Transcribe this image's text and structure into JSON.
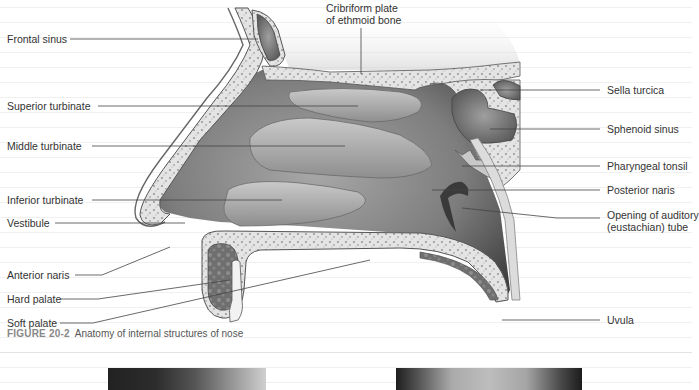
{
  "figure": {
    "number": "FIGURE 20-2",
    "caption": "Anatomy of internal structures of nose"
  },
  "labels": {
    "left": [
      {
        "id": "frontal-sinus",
        "text": "Frontal sinus"
      },
      {
        "id": "superior-turbinate",
        "text": "Superior turbinate"
      },
      {
        "id": "middle-turbinate",
        "text": "Middle turbinate"
      },
      {
        "id": "inferior-turbinate",
        "text": "Inferior turbinate"
      },
      {
        "id": "vestibule",
        "text": "Vestibule"
      },
      {
        "id": "anterior-naris",
        "text": "Anterior naris"
      },
      {
        "id": "hard-palate",
        "text": "Hard palate"
      },
      {
        "id": "soft-palate",
        "text": "Soft palate"
      }
    ],
    "top": [
      {
        "id": "cribriform-plate",
        "text_line1": "Cribriform plate",
        "text_line2": "of ethmoid bone"
      }
    ],
    "right": [
      {
        "id": "sella-turcica",
        "text": "Sella turcica"
      },
      {
        "id": "sphenoid-sinus",
        "text": "Sphenoid sinus"
      },
      {
        "id": "pharyngeal-tonsil",
        "text": "Pharyngeal tonsil"
      },
      {
        "id": "posterior-naris",
        "text": "Posterior naris"
      },
      {
        "id": "opening-auditory-tube",
        "text_line1": "Opening of auditory",
        "text_line2": "(eustachian) tube"
      },
      {
        "id": "uvula",
        "text": "Uvula"
      }
    ]
  },
  "colors": {
    "bone": "#d9d9d9",
    "cavity": "#8a8a8a",
    "turbinate": "#b5b5b5",
    "text": "#333333",
    "caption_fig": "#888888"
  }
}
